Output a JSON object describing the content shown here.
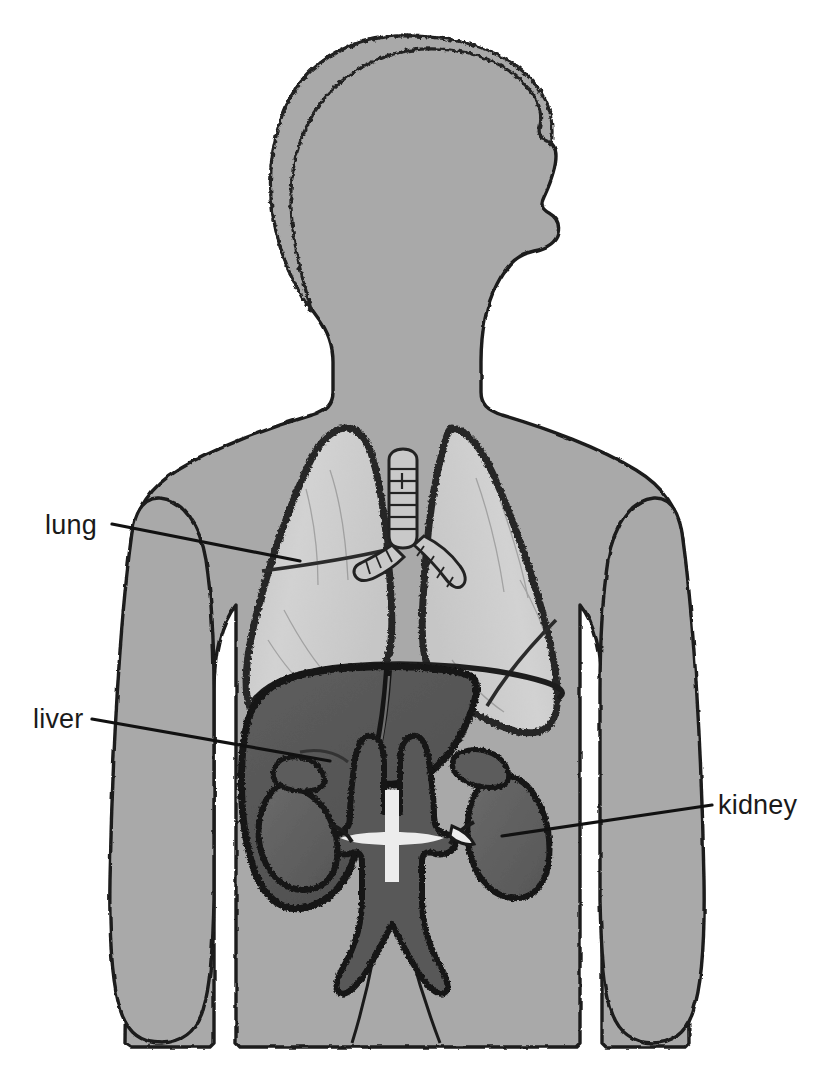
{
  "diagram": {
    "background_color": "#ffffff",
    "labels": [
      {
        "id": "lung",
        "text": "lung",
        "text_x": 45,
        "text_y": 534,
        "leader_x1": 112,
        "leader_y1": 524,
        "leader_x2": 300,
        "leader_y2": 561,
        "target": "left lung lower lobe"
      },
      {
        "id": "liver",
        "text": "liver",
        "text_x": 33,
        "text_y": 728,
        "leader_x1": 92,
        "leader_y1": 719,
        "leader_x2": 330,
        "leader_y2": 761,
        "target": "liver right lobe"
      },
      {
        "id": "kidney",
        "text": "kidney",
        "text_x": 718,
        "text_y": 814,
        "leader_x1": 712,
        "leader_y1": 805,
        "leader_x2": 502,
        "leader_y2": 836,
        "target": "right kidney"
      }
    ],
    "colors": {
      "body_fill": "#a9a9a9",
      "body_outline": "#1a1a1a",
      "lung_fill": "#cdcdcd",
      "lung_outline": "#2a2a2a",
      "liver_fill": "#585858",
      "liver_outline": "#171717",
      "kidney_fill": "#606060",
      "kidney_outline": "#141414",
      "vessel_fill": "#585858",
      "vessel_highlight": "#e8e8e8",
      "trachea_fill": "#c9c9c9",
      "label_text": "#1a1a1a",
      "leader_line": "#111111"
    },
    "organs": [
      {
        "id": "body-silhouette",
        "name": "body silhouette",
        "label": null
      },
      {
        "id": "left-lung",
        "name": "left lung",
        "label": "lung"
      },
      {
        "id": "right-lung",
        "name": "right lung",
        "label": "lung"
      },
      {
        "id": "trachea",
        "name": "trachea and bronchi",
        "label": null
      },
      {
        "id": "liver",
        "name": "liver",
        "label": "liver"
      },
      {
        "id": "left-kidney",
        "name": "left kidney",
        "label": "kidney"
      },
      {
        "id": "right-kidney",
        "name": "right kidney",
        "label": "kidney"
      },
      {
        "id": "great-vessels",
        "name": "aorta and inferior vena cava",
        "label": null
      }
    ]
  }
}
